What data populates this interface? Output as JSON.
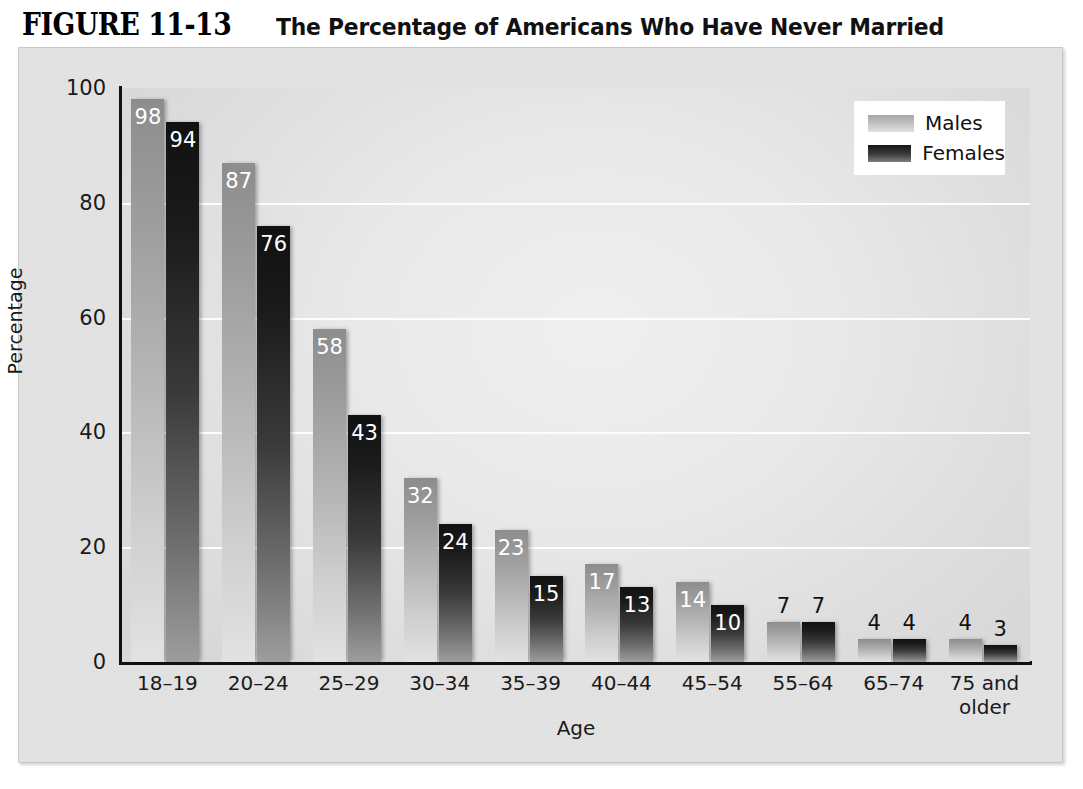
{
  "figure": {
    "number": "FIGURE 11-13",
    "caption": "The Percentage of Americans Who Have Never Married"
  },
  "legend": {
    "position": "top-right",
    "entries": [
      {
        "label": "Males",
        "swatch": "male-gradient-swatch"
      },
      {
        "label": "Females",
        "swatch": "female-gradient-swatch"
      }
    ]
  },
  "axes": {
    "y_title": "Percentage",
    "x_title": "Age",
    "y_ticks": [
      "100",
      "80",
      "60",
      "40",
      "20",
      "0"
    ]
  },
  "chart_data": {
    "type": "bar",
    "title": "The Percentage of Americans Who Have Never Married",
    "xlabel": "Age",
    "ylabel": "Percentage",
    "ylim": [
      0,
      100
    ],
    "yticks": [
      0,
      20,
      40,
      60,
      80,
      100
    ],
    "grid": true,
    "legend_position": "top-right",
    "categories": [
      "18–19",
      "20–24",
      "25–29",
      "30–34",
      "35–39",
      "40–44",
      "45–54",
      "55–64",
      "65–74",
      "75 and older"
    ],
    "series": [
      {
        "name": "Males",
        "values": [
          98,
          87,
          58,
          32,
          23,
          17,
          14,
          7,
          4,
          4
        ]
      },
      {
        "name": "Females",
        "values": [
          94,
          76,
          43,
          24,
          15,
          13,
          10,
          7,
          4,
          3
        ]
      }
    ]
  },
  "colors": {
    "page_background": "#ffffff",
    "frame_background": "#e3e3e3",
    "plot_background": "#e9e9e9",
    "gridline": "#fdfdfd",
    "axis": "#111111",
    "male_bar": "#b4b4b4",
    "female_bar": "#3a3a3a",
    "label_inside": "#ffffff",
    "label_above": "#111111"
  }
}
